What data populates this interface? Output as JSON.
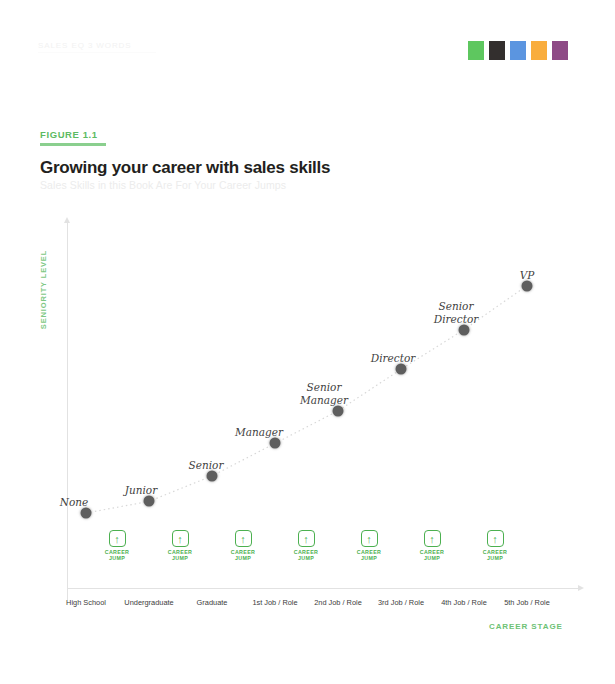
{
  "header": {
    "running_head": "SALES EQ 3 WORDS",
    "swatches": [
      {
        "name": "swatch-green",
        "color": "#5ec75f"
      },
      {
        "name": "swatch-black",
        "color": "#332f2e"
      },
      {
        "name": "swatch-blue",
        "color": "#5b95e0"
      },
      {
        "name": "swatch-orange",
        "color": "#f9ad3d"
      },
      {
        "name": "swatch-purple",
        "color": "#8e4a86"
      }
    ]
  },
  "figure": {
    "label": "FIGURE 1.1",
    "title": "Growing your career with sales skills",
    "subtitle": "Sales Skills in this Book Are For Your Career Jumps",
    "accent_color": "#5dbb63"
  },
  "chart_data": {
    "type": "scatter",
    "title": "Growing your career with sales skills",
    "subtitle": "Sales Skills in this Book Are For Your Career Jumps",
    "xlabel": "CAREER STAGE",
    "ylabel": "SENIORITY LEVEL",
    "grid": false,
    "legend": "none",
    "categories": [
      "High School",
      "Undergraduate",
      "Graduate",
      "1st Job / Role",
      "2nd Job / Role",
      "3rd Job / Role",
      "4th Job / Role",
      "5th Job / Role"
    ],
    "point_labels": [
      "None",
      "Junior",
      "Senior",
      "Manager",
      "Senior\nManager",
      "Director",
      "Senior\nDirector",
      "VP"
    ],
    "values": [
      1,
      1.5,
      2.6,
      4.0,
      5.4,
      7.2,
      8.9,
      10.8
    ],
    "xlim": [
      0,
      8
    ],
    "ylim": [
      0,
      12
    ],
    "point_color": "#5e5e5e",
    "connector": "dotted",
    "annotations": {
      "jump_label": "CAREER\nJUMP",
      "jump_count": 7,
      "jump_icon": "arrow-up-icon",
      "jump_color": "#4cb050"
    }
  }
}
